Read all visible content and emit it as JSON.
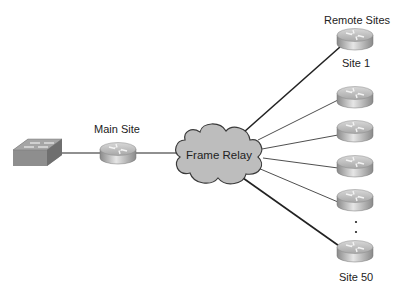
{
  "diagram": {
    "labels": {
      "main_site": "Main Site",
      "cloud": "Frame Relay",
      "remote_sites": "Remote Sites",
      "site_first": "Site 1",
      "site_last": "Site 50",
      "ellipsis": "⋮"
    },
    "nodes": [
      {
        "id": "switch",
        "type": "switch-icon"
      },
      {
        "id": "main-router",
        "type": "router-icon",
        "label": "Main Site"
      },
      {
        "id": "frame-relay-cloud",
        "type": "cloud-icon",
        "label": "Frame Relay"
      },
      {
        "id": "remote-router-1",
        "type": "router-icon",
        "label": "Site 1"
      },
      {
        "id": "remote-router-2",
        "type": "router-icon"
      },
      {
        "id": "remote-router-3",
        "type": "router-icon"
      },
      {
        "id": "remote-router-4",
        "type": "router-icon"
      },
      {
        "id": "remote-router-5",
        "type": "router-icon"
      },
      {
        "id": "remote-router-50",
        "type": "router-icon",
        "label": "Site 50"
      }
    ],
    "edges": [
      {
        "from": "switch",
        "to": "main-router"
      },
      {
        "from": "main-router",
        "to": "frame-relay-cloud"
      },
      {
        "from": "frame-relay-cloud",
        "to": "remote-router-1"
      },
      {
        "from": "frame-relay-cloud",
        "to": "remote-router-2"
      },
      {
        "from": "frame-relay-cloud",
        "to": "remote-router-3"
      },
      {
        "from": "frame-relay-cloud",
        "to": "remote-router-4"
      },
      {
        "from": "frame-relay-cloud",
        "to": "remote-router-5"
      },
      {
        "from": "frame-relay-cloud",
        "to": "remote-router-50"
      }
    ],
    "colors": {
      "cloud_fill": "#bdbdbd",
      "line": "#222222",
      "router_top": "#c8c8c8",
      "router_side": "#9a9a9a"
    }
  }
}
